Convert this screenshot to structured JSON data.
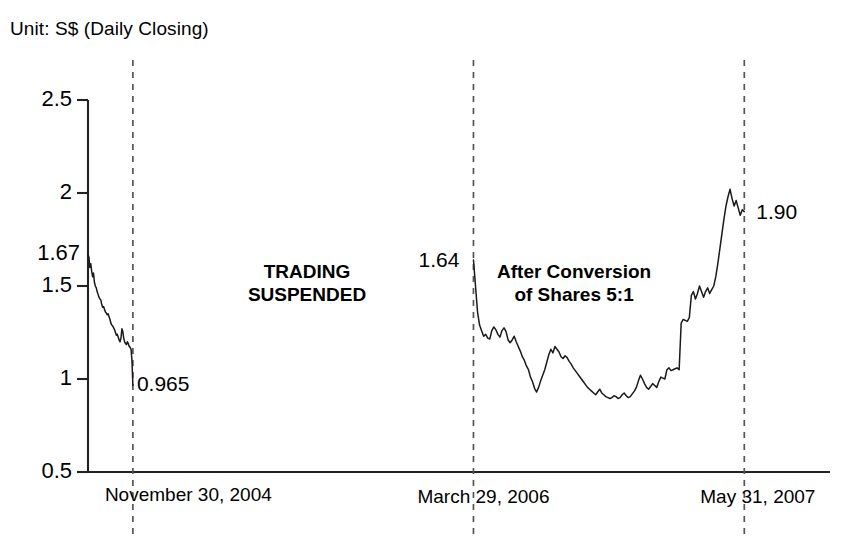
{
  "title": "Unit: S$ (Daily Closing)",
  "chart_data": {
    "type": "line",
    "title": "Unit: S$ (Daily Closing)",
    "xlabel": "",
    "ylabel": "Unit: S$ (Daily Closing)",
    "ylim": [
      0.5,
      2.5
    ],
    "grid": false,
    "legend": "none",
    "yticks": [
      "0.5",
      "1",
      "1.5",
      "2",
      "2.5"
    ],
    "ytick_values": [
      0.5,
      1,
      1.5,
      2,
      2.5
    ],
    "special_y_label": "1.67",
    "special_y_value": 1.67,
    "xticks": [
      "November 30, 2004",
      "March 29, 2006",
      "May 31, 2007"
    ],
    "xtick_positions": [
      0.0605,
      0.5195,
      0.8845
    ],
    "annotations": [
      {
        "text": "TRADING SUSPENDED",
        "lines": [
          "TRADING",
          "SUSPENDED"
        ],
        "x": 0.295,
        "y": 1.52
      },
      {
        "text": "After Conversion of Shares 5:1",
        "lines": [
          "After Conversion",
          "of Shares 5:1"
        ],
        "x": 0.655,
        "y": 1.52
      }
    ],
    "point_labels": [
      {
        "label": "0.965",
        "value": 0.965,
        "at_x": "November 30, 2004"
      },
      {
        "label": "1.64",
        "value": 1.64,
        "at_x": "March 29, 2006"
      },
      {
        "label": "1.90",
        "value": 1.9,
        "at_x": "May 31, 2007"
      }
    ],
    "gap_note": "Trading suspended between November 30, 2004 and March 29, 2006 — no data plotted.",
    "series": [
      {
        "name": "Pre-suspension price",
        "start_value": 1.67,
        "end_value": 0.965,
        "values": [
          1.67,
          1.655,
          1.6,
          1.62,
          1.58,
          1.55,
          1.57,
          1.52,
          1.5,
          1.49,
          1.47,
          1.455,
          1.44,
          1.43,
          1.425,
          1.4,
          1.385,
          1.39,
          1.375,
          1.36,
          1.355,
          1.345,
          1.35,
          1.335,
          1.32,
          1.3,
          1.29,
          1.285,
          1.275,
          1.265,
          1.25,
          1.235,
          1.24,
          1.225,
          1.21,
          1.2,
          1.22,
          1.27,
          1.255,
          1.22,
          1.2,
          1.19,
          1.185,
          1.2,
          1.19,
          1.175,
          1.17,
          1.16,
          1.1,
          0.965
        ]
      },
      {
        "name": "Post-conversion price",
        "start_value": 1.64,
        "end_value": 1.9,
        "values": [
          1.64,
          1.5,
          1.36,
          1.29,
          1.26,
          1.23,
          1.24,
          1.22,
          1.215,
          1.26,
          1.28,
          1.265,
          1.24,
          1.225,
          1.26,
          1.275,
          1.255,
          1.21,
          1.195,
          1.21,
          1.23,
          1.2,
          1.175,
          1.15,
          1.12,
          1.1,
          1.07,
          1.05,
          1.01,
          0.985,
          0.95,
          0.93,
          0.955,
          0.99,
          1.02,
          1.05,
          1.09,
          1.13,
          1.16,
          1.14,
          1.175,
          1.16,
          1.145,
          1.12,
          1.11,
          1.125,
          1.115,
          1.095,
          1.08,
          1.06,
          1.045,
          1.03,
          1.015,
          1.0,
          0.985,
          0.97,
          0.955,
          0.945,
          0.935,
          0.925,
          0.915,
          0.93,
          0.945,
          0.925,
          0.915,
          0.905,
          0.9,
          0.895,
          0.9,
          0.91,
          0.905,
          0.895,
          0.9,
          0.915,
          0.925,
          0.91,
          0.9,
          0.905,
          0.92,
          0.935,
          0.955,
          0.99,
          1.02,
          1.0,
          0.975,
          0.955,
          0.945,
          0.96,
          0.975,
          0.965,
          0.955,
          0.985,
          1.01,
          1.005,
          1.0,
          1.05,
          1.06,
          1.045,
          1.05,
          1.055,
          1.06,
          1.05,
          1.3,
          1.32,
          1.315,
          1.31,
          1.33,
          1.45,
          1.47,
          1.43,
          1.46,
          1.5,
          1.47,
          1.44,
          1.47,
          1.49,
          1.46,
          1.48,
          1.5,
          1.55,
          1.62,
          1.7,
          1.78,
          1.86,
          1.93,
          1.98,
          2.02,
          1.97,
          1.93,
          1.96,
          1.92,
          1.88,
          1.91,
          1.9
        ]
      }
    ]
  }
}
